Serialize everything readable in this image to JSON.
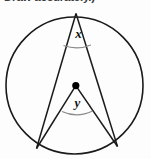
{
  "page": {
    "width": 151,
    "height": 159,
    "background_color": "#fdfdfd",
    "header_text": "Draw accurately.)"
  },
  "figure": {
    "name": "circle-with-inscribed-and-central-angle",
    "stroke_color": "#1a1a1a",
    "center_dot_color": "#000000",
    "circle": {
      "cx": 74.5,
      "cy": 85.5,
      "r": 68.5
    },
    "center_point": {
      "cx": 75.8,
      "cy": 85.6,
      "r": 3.6
    },
    "apex_point": {
      "x": 76.0,
      "y": 13.5
    },
    "left_point": {
      "x": 36.5,
      "y": 148.5
    },
    "right_point": {
      "x": 117.5,
      "y": 146.5
    },
    "labels": {
      "x": {
        "text": "x",
        "cx": 78.5,
        "cy": 38.0
      },
      "y": {
        "text": "y",
        "cx": 77.5,
        "cy": 107.0
      }
    },
    "arcs": {
      "x_arc": "M 63.5 45.5 Q 77.5 50.5 91.0 45.0",
      "y_arc": "M 62.0 111.5 Q 77.0 118.5 92.5 111.0"
    }
  }
}
